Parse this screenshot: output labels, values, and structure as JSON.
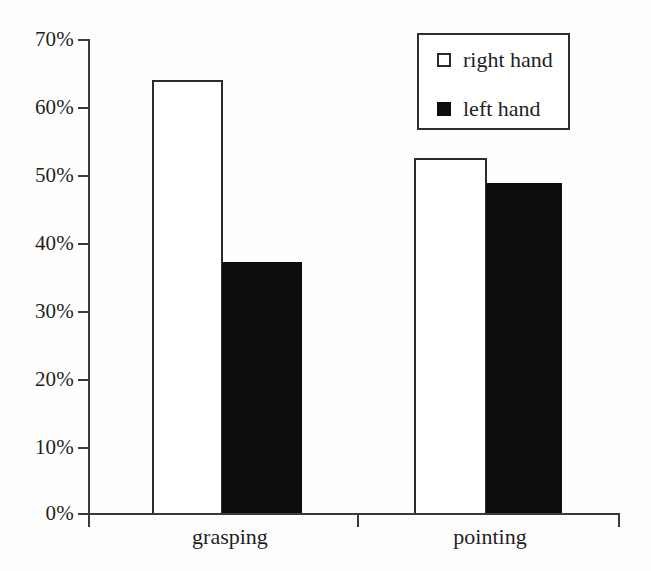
{
  "chart_data": {
    "type": "bar",
    "title": "",
    "subtitle": "",
    "xlabel": "",
    "ylabel": "",
    "categories": [
      "grasping",
      "pointing"
    ],
    "series": [
      {
        "name": "right hand",
        "values": [
          64,
          52.5
        ],
        "color": "#ffffff",
        "swatch": "light"
      },
      {
        "name": "left hand",
        "values": [
          37,
          48.7
        ],
        "color": "#0d0d0d",
        "swatch": "dark"
      }
    ],
    "ylim": [
      0,
      70
    ],
    "y_tick_values": [
      0,
      10,
      20,
      30,
      40,
      50,
      60,
      70
    ],
    "y_tick_labels": [
      "0%",
      "10%",
      "20%",
      "30%",
      "40%",
      "50%",
      "60%",
      "70%"
    ],
    "y_axis_unit": "%",
    "grid": false,
    "legend_position": "top-right",
    "legend_entries": [
      "right hand",
      "left hand"
    ],
    "annotations": []
  },
  "axes": {
    "y_ticks": [
      {
        "label": "70%",
        "value": 70
      },
      {
        "label": "60%",
        "value": 60
      },
      {
        "label": "50%",
        "value": 50
      },
      {
        "label": "40%",
        "value": 40
      },
      {
        "label": "30%",
        "value": 30
      },
      {
        "label": "20%",
        "value": 20
      },
      {
        "label": "10%",
        "value": 10
      },
      {
        "label": "0%",
        "value": 0
      }
    ],
    "x_categories": [
      {
        "label": "grasping"
      },
      {
        "label": "pointing"
      }
    ]
  },
  "legend": {
    "items": [
      {
        "label": "right hand",
        "swatch": "white-square-swatch"
      },
      {
        "label": "left hand",
        "swatch": "black-square-swatch"
      }
    ]
  },
  "colors": {
    "bar_light_fill": "#ffffff",
    "bar_dark_fill": "#0d0d0d",
    "bar_stroke": "#2b2b2b",
    "axis": "#3a3a3a",
    "text": "#1f1f1f",
    "background": "#fefefe"
  }
}
